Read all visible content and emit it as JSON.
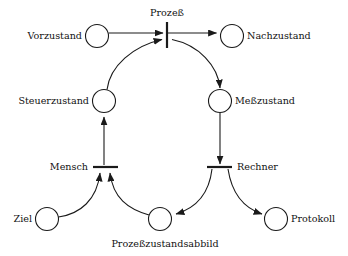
{
  "diagram": {
    "colors": {
      "stroke": "#1a1a1a",
      "fill": "#ffffff",
      "background": "#ffffff",
      "text": "#111111"
    },
    "places": [
      {
        "id": "vorzustand",
        "label": "Vorzustand",
        "cx": 97,
        "cy": 36,
        "r": 11.5,
        "label_x": 82,
        "label_y": 39,
        "anchor": "end"
      },
      {
        "id": "nachzustand",
        "label": "Nachzustand",
        "cx": 232,
        "cy": 36,
        "r": 11.5,
        "label_x": 247,
        "label_y": 39,
        "anchor": "start"
      },
      {
        "id": "steuerzustand",
        "label": "Steuerzustand",
        "cx": 104,
        "cy": 101,
        "r": 11.5,
        "label_x": 89,
        "label_y": 104,
        "anchor": "end"
      },
      {
        "id": "messzustand",
        "label": "Meßzustand",
        "cx": 220,
        "cy": 101,
        "r": 11.5,
        "label_x": 235,
        "label_y": 104,
        "anchor": "start"
      },
      {
        "id": "ziel",
        "label": "Ziel",
        "cx": 47,
        "cy": 219,
        "r": 11.5,
        "label_x": 32,
        "label_y": 222,
        "anchor": "end"
      },
      {
        "id": "prozesszustandsabbild",
        "label": "Prozeßzustandsabbild",
        "cx": 160,
        "cy": 219,
        "r": 11.5,
        "label_x": 165,
        "label_y": 247,
        "anchor": "middle"
      },
      {
        "id": "protokoll",
        "label": "Protokoll",
        "cx": 276,
        "cy": 219,
        "r": 11.5,
        "label_x": 291,
        "label_y": 222,
        "anchor": "start"
      }
    ],
    "transitions": [
      {
        "id": "prozess",
        "label": "Prozeß",
        "orientation": "vertical",
        "x": 167,
        "y1": 22,
        "y2": 48,
        "label_x": 167,
        "label_y": 16,
        "anchor": "middle"
      },
      {
        "id": "mensch",
        "label": "Mensch",
        "orientation": "horizontal",
        "y": 167,
        "x1": 93,
        "x2": 118,
        "label_x": 88,
        "label_y": 170,
        "anchor": "end"
      },
      {
        "id": "rechner",
        "label": "Rechner",
        "orientation": "horizontal",
        "y": 167,
        "x1": 207,
        "x2": 232,
        "label_x": 237,
        "label_y": 170,
        "anchor": "start"
      }
    ],
    "arcs": [
      {
        "id": "arc-vorzustand-prozess",
        "from": "vorzustand",
        "to": "prozess",
        "kind": "straight"
      },
      {
        "id": "arc-prozess-nachzustand",
        "from": "prozess",
        "to": "nachzustand",
        "kind": "straight"
      },
      {
        "id": "arc-steuerzustand-prozess",
        "from": "steuerzustand",
        "to": "prozess",
        "kind": "arc"
      },
      {
        "id": "arc-prozess-messzustand",
        "from": "prozess",
        "to": "messzustand",
        "kind": "arc"
      },
      {
        "id": "arc-mensch-steuerzustand",
        "from": "mensch",
        "to": "steuerzustand",
        "kind": "straight"
      },
      {
        "id": "arc-messzustand-rechner",
        "from": "messzustand",
        "to": "rechner",
        "kind": "straight"
      },
      {
        "id": "arc-ziel-mensch",
        "from": "ziel",
        "to": "mensch",
        "kind": "arc"
      },
      {
        "id": "arc-abbild-mensch",
        "from": "prozesszustandsabbild",
        "to": "mensch",
        "kind": "arc"
      },
      {
        "id": "arc-rechner-abbild",
        "from": "rechner",
        "to": "prozesszustandsabbild",
        "kind": "arc"
      },
      {
        "id": "arc-rechner-protokoll",
        "from": "rechner",
        "to": "protokoll",
        "kind": "arc"
      }
    ]
  }
}
